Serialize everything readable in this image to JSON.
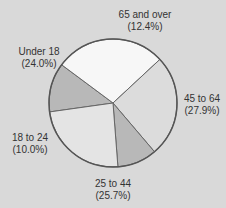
{
  "chart_data": {
    "type": "pie",
    "title": "",
    "categories": [
      "65 and over",
      "45 to 64",
      "25 to 44",
      "18 to 24",
      "Under 18"
    ],
    "values": [
      12.4,
      27.9,
      25.7,
      10.0,
      24.0
    ],
    "unit": "%",
    "legend": "none (direct labels)",
    "slices": [
      {
        "name": "65 and over",
        "value": 12.4,
        "pct_label": "(12.4%)",
        "color": "#b8b8b8"
      },
      {
        "name": "45 to 64",
        "value": 27.9,
        "pct_label": "(27.9%)",
        "color": "#f7f7f7"
      },
      {
        "name": "25 to 44",
        "value": 25.7,
        "pct_label": "(25.7%)",
        "color": "#dcdcdc"
      },
      {
        "name": "18 to 24",
        "value": 10.0,
        "pct_label": "(10.0%)",
        "color": "#b8b8b8"
      },
      {
        "name": "Under 18",
        "value": 24.0,
        "pct_label": "(24.0%)",
        "color": "#e4e4e4"
      }
    ]
  },
  "colors": {
    "background": "#d9d9d9",
    "outline": "#555555"
  }
}
